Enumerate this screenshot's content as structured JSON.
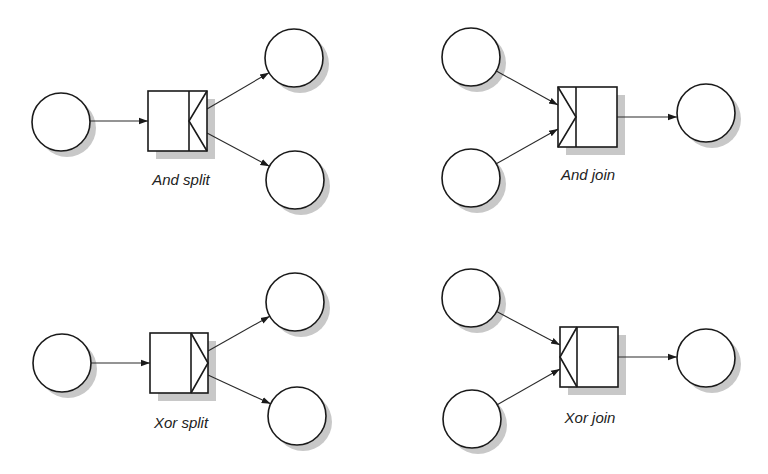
{
  "diagrams": [
    {
      "id": "and-split",
      "label": "And split",
      "type": "split",
      "gate": "and",
      "label_pos": [
        181,
        185
      ],
      "box": {
        "x": 148,
        "y": 91,
        "w": 59,
        "h": 60,
        "divider_x": 189
      },
      "inputs": [
        {
          "cx": 61,
          "cy": 122,
          "r": 29
        }
      ],
      "outputs": [
        {
          "cx": 294,
          "cy": 58,
          "r": 29
        },
        {
          "cx": 295,
          "cy": 180,
          "r": 29
        }
      ]
    },
    {
      "id": "and-join",
      "label": "And join",
      "type": "join",
      "gate": "and",
      "label_pos": [
        588,
        180
      ],
      "box": {
        "x": 558,
        "y": 87,
        "w": 59,
        "h": 60,
        "divider_x": 576
      },
      "inputs": [
        {
          "cx": 471,
          "cy": 57,
          "r": 29
        },
        {
          "cx": 471,
          "cy": 178,
          "r": 29
        }
      ],
      "outputs": [
        {
          "cx": 706,
          "cy": 113,
          "r": 29
        }
      ]
    },
    {
      "id": "xor-split",
      "label": "Xor split",
      "type": "split",
      "gate": "xor",
      "label_pos": [
        181,
        428
      ],
      "box": {
        "x": 150,
        "y": 333,
        "w": 58,
        "h": 60,
        "divider_x": 191
      },
      "inputs": [
        {
          "cx": 62,
          "cy": 363,
          "r": 29
        }
      ],
      "outputs": [
        {
          "cx": 295,
          "cy": 302,
          "r": 29
        },
        {
          "cx": 297,
          "cy": 416,
          "r": 29
        }
      ]
    },
    {
      "id": "xor-join",
      "label": "Xor join",
      "type": "join",
      "gate": "xor",
      "label_pos": [
        590,
        423
      ],
      "box": {
        "x": 560,
        "y": 327,
        "w": 58,
        "h": 60,
        "divider_x": 577
      },
      "inputs": [
        {
          "cx": 471,
          "cy": 298,
          "r": 29
        },
        {
          "cx": 472,
          "cy": 419,
          "r": 29
        }
      ],
      "outputs": [
        {
          "cx": 706,
          "cy": 358,
          "r": 29
        }
      ]
    }
  ],
  "colors": {
    "stroke": "#1a1a1a",
    "shadow": "#c8c8c8",
    "fill": "#ffffff"
  }
}
